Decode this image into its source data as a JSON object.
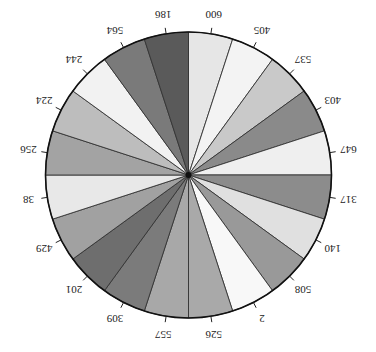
{
  "chart_data": {
    "type": "pie",
    "title": "",
    "orientation": "rotated 180 degrees (upside-down)",
    "slice_mode": "equal-angle slices labeled with values",
    "categories": [
      "600",
      "405",
      "537",
      "403",
      "647",
      "317",
      "140",
      "508",
      "2",
      "526",
      "557",
      "309",
      "201",
      "429",
      "38",
      "256",
      "224",
      "244",
      "564",
      "186"
    ],
    "values": [
      600,
      405,
      537,
      403,
      647,
      317,
      140,
      508,
      2,
      526,
      557,
      309,
      201,
      429,
      38,
      256,
      224,
      244,
      564,
      186
    ],
    "colors": [
      "#e6e6e6",
      "#f3f3f3",
      "#c9c9c9",
      "#8a8a8a",
      "#efefef",
      "#8c8c8c",
      "#e0e0e0",
      "#999999",
      "#f8f8f8",
      "#a9a9a9",
      "#a8a8a8",
      "#7b7b7b",
      "#6e6e6e",
      "#a1a1a1",
      "#e8e8e8",
      "#a3a3a3",
      "#bdbdbd",
      "#f2f2f2",
      "#7a7a7a",
      "#5a5a5a"
    ],
    "legend": "none",
    "grid": false
  }
}
